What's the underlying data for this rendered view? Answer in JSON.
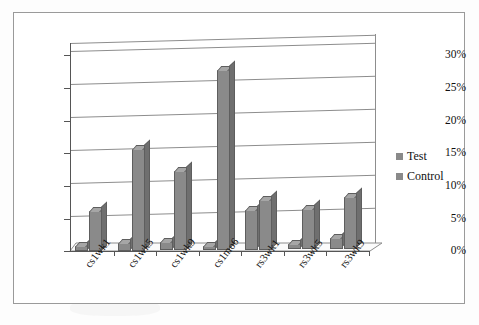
{
  "chart_data": {
    "type": "bar",
    "title": "",
    "xlabel": "",
    "ylabel": "",
    "categories": [
      "cs1wk1",
      "cs1wk5",
      "cs1wk9",
      "cs1mo6",
      "rs3wk1",
      "rs3wk5",
      "rs3wk9"
    ],
    "series": [
      {
        "name": "Test",
        "color": "#8a8a8a",
        "values": [
          0.8,
          1.2,
          1.2,
          0.6,
          6.0,
          0.8,
          1.6
        ]
      },
      {
        "name": "Control",
        "color": "#8a8a8a",
        "values": [
          6.2,
          15.6,
          12.2,
          27.6,
          7.6,
          6.2,
          8.0
        ]
      }
    ],
    "ylim": [
      0,
      30
    ],
    "ytick_values": [
      0,
      5,
      10,
      15,
      20,
      25,
      30
    ],
    "ytick_labels": [
      "0%",
      "5%",
      "10%",
      "15%",
      "20%",
      "25%",
      "30%"
    ],
    "grid": true,
    "legend_position": "right",
    "style": "3d-column",
    "value_suffix": "%"
  },
  "legend": {
    "entries": [
      {
        "label": "Test"
      },
      {
        "label": "Control"
      }
    ]
  },
  "colors": {
    "bar_fill": "#8a8a8a",
    "bar_top": "#a6a6a6",
    "bar_side": "#6f6f6f",
    "bar_edge": "#5e5e5e",
    "gridline": "#8d8d8d",
    "axis": "#555555",
    "frame": "#9a9a9a",
    "background": "#ffffff",
    "text": "#111111"
  }
}
